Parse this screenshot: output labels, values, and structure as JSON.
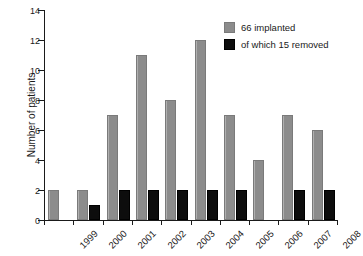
{
  "chart_data": {
    "type": "bar",
    "title": "",
    "xlabel": "",
    "ylabel": "Number of patients",
    "categories": [
      "1999",
      "2000",
      "2001",
      "2002",
      "2003",
      "2004",
      "2005",
      "2006",
      "2007",
      "2008"
    ],
    "series": [
      {
        "name": "66 implanted",
        "color": "#8c8c8c",
        "values": [
          2,
          2,
          7,
          11,
          8,
          12,
          7,
          4,
          7,
          6
        ]
      },
      {
        "name": "of which 15 removed",
        "color": "#0d0d0d",
        "values": [
          0,
          1,
          2,
          2,
          2,
          2,
          2,
          0,
          2,
          2
        ]
      }
    ],
    "ylim": [
      0,
      14
    ],
    "yticks": [
      0,
      2,
      4,
      6,
      8,
      10,
      12,
      14
    ],
    "grid": false,
    "legend_position": "top-right"
  },
  "legend": {
    "items": [
      {
        "label": "66 implanted",
        "swatch": "implanted"
      },
      {
        "label": "of which 15 removed",
        "swatch": "removed"
      }
    ]
  }
}
